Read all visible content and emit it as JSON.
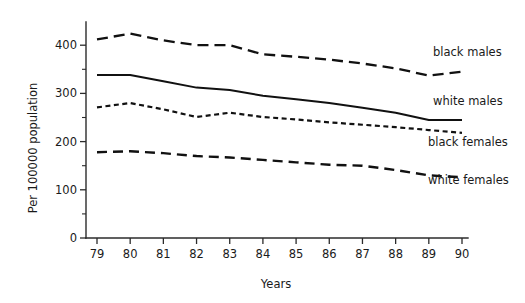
{
  "chart_data": {
    "type": "line",
    "title": "",
    "xlabel": "Years",
    "ylabel": "Per 100000 population",
    "x": [
      79,
      80,
      81,
      82,
      83,
      84,
      85,
      86,
      87,
      88,
      89,
      90
    ],
    "xtick_labels": [
      "79",
      "80",
      "81",
      "82",
      "83",
      "84",
      "85",
      "86",
      "87",
      "88",
      "89",
      "90"
    ],
    "ytick_labels": [
      "0",
      "100",
      "200",
      "300",
      "400"
    ],
    "ytick_values": [
      0,
      100,
      200,
      300,
      400
    ],
    "yminor_values": [
      50,
      150,
      250,
      350,
      450
    ],
    "ylim": [
      0,
      455
    ],
    "xlim": [
      79,
      90
    ],
    "grid": false,
    "legend_position": "inline-right",
    "series": [
      {
        "name": "black males",
        "label": "black males",
        "style": "long-dash",
        "color": "#111111",
        "values": [
          412,
          424,
          410,
          400,
          400,
          381,
          376,
          370,
          362,
          352,
          337,
          345
        ]
      },
      {
        "name": "white males",
        "label": "white males",
        "style": "solid",
        "color": "#111111",
        "values": [
          338,
          338,
          325,
          312,
          307,
          295,
          288,
          280,
          270,
          260,
          245,
          245
        ]
      },
      {
        "name": "black females",
        "label": "black females",
        "style": "short-dash",
        "color": "#111111",
        "values": [
          271,
          280,
          267,
          251,
          260,
          251,
          246,
          240,
          235,
          230,
          224,
          218
        ]
      },
      {
        "name": "white females",
        "label": "white females",
        "style": "medium-dash",
        "color": "#111111",
        "values": [
          178,
          180,
          176,
          170,
          167,
          162,
          157,
          152,
          150,
          141,
          130,
          126
        ]
      }
    ]
  },
  "labels": {
    "black_males": "black males",
    "white_males": "white males",
    "black_females": "black females",
    "white_females": "white females",
    "y_axis_title": "Per 100000 population",
    "x_axis_title": "Years"
  }
}
